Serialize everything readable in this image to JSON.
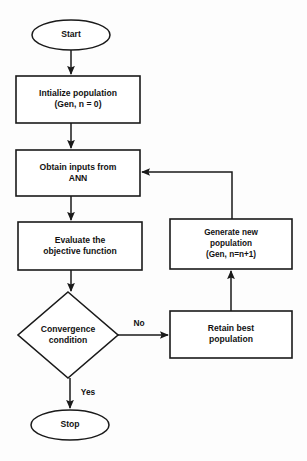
{
  "diagram": {
    "type": "flowchart",
    "canvas": {
      "width": 307,
      "height": 461
    },
    "colors": {
      "background": "#fdfdfd",
      "stroke": "#1a1a1a",
      "node_fill": "#ffffff",
      "text": "#121212"
    },
    "nodes": [
      {
        "id": "start",
        "shape": "ellipse",
        "label": "Start",
        "lines": [
          "Start"
        ],
        "cx": 71,
        "cy": 35,
        "rx": 39,
        "ry": 15
      },
      {
        "id": "initialize-population",
        "shape": "rectangle",
        "label": "Intialize population (Gen, n = 0)",
        "lines": [
          "Intialize population",
          "(Gen, n = 0)"
        ],
        "x": 16,
        "y": 76,
        "w": 124,
        "h": 47
      },
      {
        "id": "obtain-inputs-ann",
        "shape": "rectangle",
        "label": "Obtain inputs from ANN",
        "lines": [
          "Obtain inputs from",
          "ANN"
        ],
        "x": 16,
        "y": 150,
        "w": 124,
        "h": 46
      },
      {
        "id": "evaluate-objective-function",
        "shape": "rectangle",
        "label": "Evaluate the objective function",
        "lines": [
          "Evaluate the",
          "objective function"
        ],
        "x": 18,
        "y": 222,
        "w": 124,
        "h": 48
      },
      {
        "id": "convergence-condition",
        "shape": "diamond",
        "label": "Convergence condition",
        "lines": [
          "Convergence",
          "condition"
        ],
        "cx": 68,
        "cy": 335,
        "rx": 50,
        "ry": 43
      },
      {
        "id": "stop",
        "shape": "ellipse",
        "label": "Stop",
        "lines": [
          "Stop"
        ],
        "cx": 70,
        "cy": 425,
        "rx": 39,
        "ry": 15
      },
      {
        "id": "generate-new-population",
        "shape": "rectangle",
        "label": "Generate new population (Gen, n=n+1)",
        "lines": [
          "Generate new",
          "population",
          "(Gen, n=n+1)"
        ],
        "x": 170,
        "y": 219,
        "w": 122,
        "h": 50
      },
      {
        "id": "retain-best-population",
        "shape": "rectangle",
        "label": "Retain best population",
        "lines": [
          "Retain best",
          "population"
        ],
        "x": 170,
        "y": 311,
        "w": 122,
        "h": 47
      }
    ],
    "edges": [
      {
        "id": "start-to-initialize",
        "from": "start",
        "to": "initialize-population",
        "label": "",
        "path": "M 71 50 L 71 74"
      },
      {
        "id": "initialize-to-obtain",
        "from": "initialize-population",
        "to": "obtain-inputs-ann",
        "label": "",
        "path": "M 71 123 L 71 148"
      },
      {
        "id": "obtain-to-evaluate",
        "from": "obtain-inputs-ann",
        "to": "evaluate-objective-function",
        "label": "",
        "path": "M 71 196 L 71 220"
      },
      {
        "id": "evaluate-to-convergence",
        "from": "evaluate-objective-function",
        "to": "convergence-condition",
        "label": "",
        "path": "M 71 270 L 71 291"
      },
      {
        "id": "convergence-no-to-retain",
        "from": "convergence-condition",
        "to": "retain-best-population",
        "label": "No",
        "label_x": 139,
        "label_y": 324,
        "path": "M 118 335 L 168 335"
      },
      {
        "id": "retain-to-generate",
        "from": "retain-best-population",
        "to": "generate-new-population",
        "label": "",
        "path": "M 231 311 L 231 271"
      },
      {
        "id": "generate-to-obtain-feedback",
        "from": "generate-new-population",
        "to": "obtain-inputs-ann",
        "label": "",
        "path": "M 232 219 L 232 172 L 142 172"
      },
      {
        "id": "convergence-yes-to-stop",
        "from": "convergence-condition",
        "to": "stop",
        "label": "Yes",
        "label_x": 88,
        "label_y": 393,
        "path": "M 70 378 L 70 408"
      }
    ]
  }
}
